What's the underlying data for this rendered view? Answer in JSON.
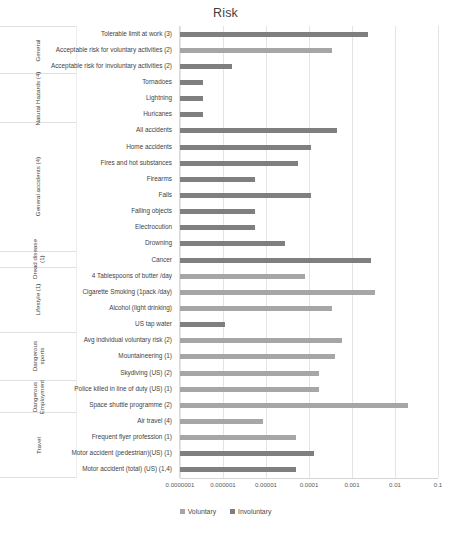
{
  "chart_data": {
    "type": "bar",
    "orientation": "horizontal",
    "title": "Risk",
    "xlabel": "",
    "ylabel": "",
    "xscale": "log",
    "xlim": [
      1e-07,
      0.1
    ],
    "xticks": [
      "0.0000001",
      "0.000001",
      "0.00001",
      "0.0001",
      "0.001",
      "0.01",
      "0.1"
    ],
    "xtick_values": [
      1e-07,
      1e-06,
      1e-05,
      0.0001,
      0.001,
      0.01,
      0.1
    ],
    "grid": true,
    "legend_position": "bottom",
    "series": [
      {
        "name": "Voluntary",
        "color": "#a6a6a6"
      },
      {
        "name": "Involuntary",
        "color": "#7f7f7f"
      }
    ],
    "groups": [
      {
        "label": "General",
        "count": 3,
        "wrapped": false
      },
      {
        "label": "Natural Hazards (4)",
        "count": 3,
        "wrapped": false
      },
      {
        "label": "General accidents (4)",
        "count": 8,
        "wrapped": false
      },
      {
        "label": "Dread disease (1)",
        "count": 1,
        "wrapped": true
      },
      {
        "label": "Lifestyle (1)",
        "count": 4,
        "wrapped": false
      },
      {
        "label": "Dangerous sports",
        "count": 3,
        "wrapped": true
      },
      {
        "label": "Dangerous Employment",
        "count": 2,
        "wrapped": true
      },
      {
        "label": "Travel",
        "count": 4,
        "wrapped": false
      }
    ],
    "categories": [
      "Tolerable limit at work (3)",
      "Acceptable risk for voluntary activities (2)",
      "Acceptable risk for involuntary activities (2)",
      "Tornadoes",
      "Lightning",
      "Huricanes",
      "All accidents",
      "Home accidents",
      "Fires and hot substances",
      "Firearms",
      "Falls",
      "Falling objects",
      "Electrocution",
      "Drowning",
      "Cancer",
      "4 Tablespoons of butter /day",
      "Cigarette Smoking (1pack /day)",
      "Alcohol (light drinking)",
      "US tap water",
      "Avg individual voluntary risk (2)",
      "Mountaineering (1)",
      "Skydiving (US) (2)",
      "Police killed in line of duty (US) (1)",
      "Space shuttle programme (2)",
      "Air travel (4)",
      "Frequent flyer profession (1)",
      "Motor accident (pedestrian)(US) (1)",
      "Motor accident (total) (US) (1,4)"
    ],
    "values": [
      0.0023,
      0.00034,
      1.6e-06,
      3.5e-07,
      3.5e-07,
      3.5e-07,
      0.00045,
      0.00011,
      5.5e-05,
      5.5e-06,
      0.00011,
      5.5e-06,
      5.5e-06,
      2.8e-05,
      0.0028,
      8e-05,
      0.0035,
      0.00035,
      1.1e-06,
      0.0006,
      0.0004,
      0.00017,
      0.00017,
      0.02,
      8.5e-06,
      5e-05,
      0.00013,
      5e-05
    ],
    "series_of": [
      "Involuntary",
      "Voluntary",
      "Involuntary",
      "Involuntary",
      "Involuntary",
      "Involuntary",
      "Involuntary",
      "Involuntary",
      "Involuntary",
      "Involuntary",
      "Involuntary",
      "Involuntary",
      "Involuntary",
      "Involuntary",
      "Involuntary",
      "Voluntary",
      "Voluntary",
      "Voluntary",
      "Involuntary",
      "Voluntary",
      "Voluntary",
      "Voluntary",
      "Voluntary",
      "Voluntary",
      "Voluntary",
      "Voluntary",
      "Involuntary",
      "Involuntary"
    ]
  }
}
